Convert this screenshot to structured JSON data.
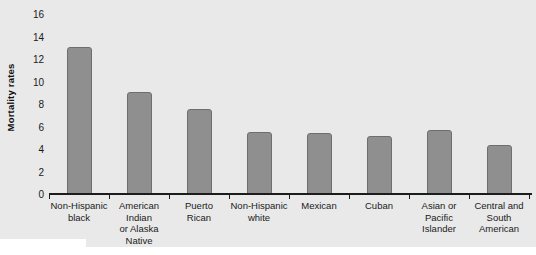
{
  "chart_data": {
    "type": "bar",
    "title": "",
    "subtitle": "",
    "xlabel": "",
    "ylabel": "Mortality rates",
    "ylim": [
      0,
      16
    ],
    "ytick_step": 2,
    "yticks": [
      0,
      2,
      4,
      6,
      8,
      10,
      12,
      14,
      16
    ],
    "grid": false,
    "legend": null,
    "bar_color": "#8f8f8f",
    "bar_border_color": "#6e6e6e",
    "panel_background": "#e9e9e9",
    "axis_color": "#1c1c1c",
    "categories": [
      "Non-Hispanic black",
      "American Indian or Alaska Native",
      "Puerto Rican",
      "Non-Hispanic white",
      "Mexican",
      "Cuban",
      "Asian or Pacific Islander",
      "Central and South American"
    ],
    "category_label_lines": [
      [
        "Non-Hispanic",
        "black"
      ],
      [
        "American",
        "Indian",
        "or Alaska",
        "Native"
      ],
      [
        "Puerto",
        "Rican"
      ],
      [
        "Non-Hispanic",
        "white"
      ],
      [
        "Mexican"
      ],
      [
        "Cuban"
      ],
      [
        "Asian or",
        "Pacific",
        "Islander"
      ],
      [
        "Central and",
        "South",
        "American"
      ]
    ],
    "values": [
      13.1,
      9.1,
      7.6,
      5.5,
      5.4,
      5.2,
      5.7,
      4.4
    ]
  }
}
